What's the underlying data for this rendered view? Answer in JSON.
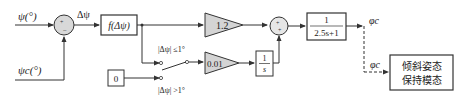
{
  "diagram": {
    "type": "block-diagram",
    "colors": {
      "line": "#333333",
      "fill_gray": "#d4d4d4",
      "box_fill": "#ffffff"
    },
    "inputs": {
      "psi": "ψ(°)",
      "psi_c": "ψc(°)"
    },
    "sum1": {
      "signs": "+ −",
      "output_label": "Δψ"
    },
    "nonlinear_block": {
      "label": "f(Δψ)"
    },
    "gain_p": {
      "value": "1.2"
    },
    "gain_i": {
      "value": "0.01"
    },
    "integrator": {
      "numerator": "1",
      "denominator": "s"
    },
    "zero_block": {
      "label": "0"
    },
    "switch": {
      "cond_upper": "|Δψ| ≤1°",
      "cond_lower": "|Δψ| >1°"
    },
    "sum2": {
      "signs": "+ +"
    },
    "lag_filter": {
      "numerator": "1",
      "denominator": "2.5s+1"
    },
    "output": {
      "phi_c": "φc",
      "phi_c2": "φc"
    },
    "target_block": {
      "line1": "倾斜姿态",
      "line2": "保持模态"
    }
  }
}
